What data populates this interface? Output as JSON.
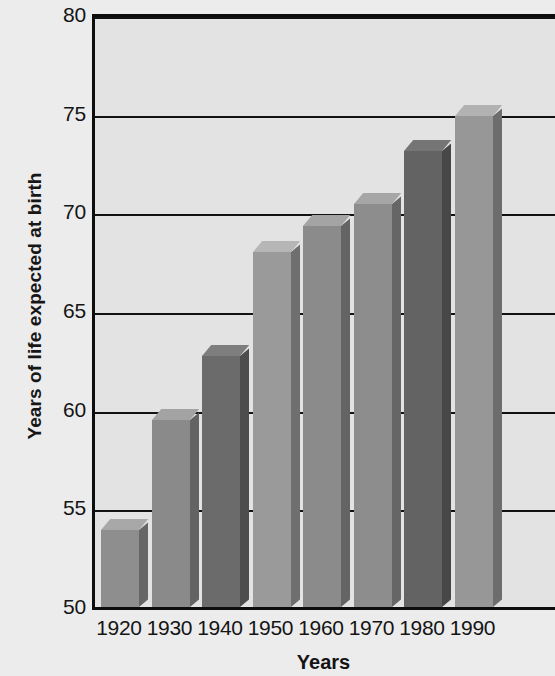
{
  "chart_data": {
    "type": "bar",
    "title": "",
    "xlabel": "Years",
    "ylabel": "Years of life expected at birth",
    "categories": [
      "1920",
      "1930",
      "1940",
      "1950",
      "1960",
      "1970",
      "1980",
      "1990"
    ],
    "values": [
      53.9,
      59.5,
      62.7,
      68.0,
      69.3,
      70.4,
      73.1,
      74.9
    ],
    "ylim": [
      50,
      80
    ],
    "yticks": [
      50,
      55,
      60,
      65,
      70,
      75,
      80
    ],
    "ytick_labels": [
      "50",
      "55",
      "60",
      "65",
      "70",
      "75",
      "80"
    ],
    "grid": true,
    "legend": null,
    "bar_colors": [
      "#8e8e8e",
      "#8a8a8a",
      "#6b6b6b",
      "#9a9a9a",
      "#8b8b8b",
      "#8d8d8d",
      "#636363",
      "#979797"
    ],
    "plot_background": "#e3e3e3",
    "figure_background": "#ececed",
    "axis_color": "#0d0d0d",
    "note": "Chart is cropped at the right edge of the screenshot; the 1990 bar is the last one visible."
  }
}
